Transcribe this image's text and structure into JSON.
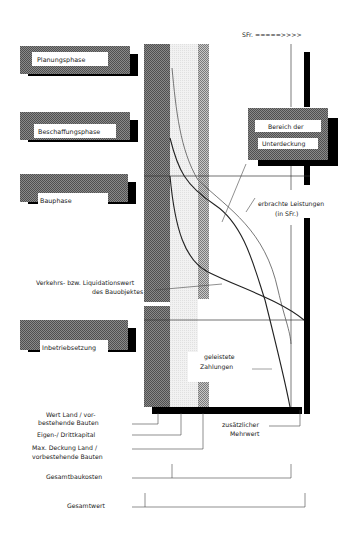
{
  "header": {
    "currency_axis": "SFr. =====>>>>"
  },
  "phases": [
    {
      "label": "Planungsphase"
    },
    {
      "label": "Beschaffungsphase"
    },
    {
      "label": "Bauphase"
    },
    {
      "label": "Inbetriebsetzung"
    }
  ],
  "shortfall_box": {
    "line1": "Bereich der",
    "line2": "Unterdeckung"
  },
  "annotations": {
    "services": {
      "line1": "erbrachte Leistungen",
      "line2": "(in SFr.)"
    },
    "market_value": {
      "line1": "Verkehrs- bzw. Liquidationswert",
      "line2": "des Bauobjektes"
    },
    "payments": {
      "line1": "geleistete",
      "line2": "Zahlungen"
    },
    "added_value": {
      "line1": "zusätzlicher",
      "line2": "Mehrwert"
    }
  },
  "legend_bottom": [
    {
      "line1": "Wert Land / vor-",
      "line2": "bestehende Bauten"
    },
    {
      "line1": "Eigen-/ Drittkapital",
      "line2": ""
    },
    {
      "line1": "Max. Deckung Land /",
      "line2": "vorbestehende Bauten"
    },
    {
      "line1": "Gesamtbaukosten",
      "line2": ""
    },
    {
      "line1": "Gesamtwert",
      "line2": ""
    }
  ],
  "colors": {
    "dark_hatch": "#6e6e6e",
    "medium_hatch": "#9a9a9a",
    "light_fill": "#ececec",
    "shadow": "#000000",
    "line": "#333333"
  }
}
